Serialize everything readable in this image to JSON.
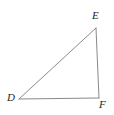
{
  "figure": {
    "name": "triangle-def",
    "background_color": "#ffffff",
    "width": 114,
    "height": 115,
    "stroke_color": "#8a8a8a",
    "stroke_width": 1,
    "label_color": "#231f20",
    "vertices": [
      {
        "id": "D",
        "label": "D",
        "x": 19,
        "y": 99,
        "label_x": 7,
        "label_y": 92
      },
      {
        "id": "E",
        "label": "E",
        "x": 96,
        "y": 28,
        "label_x": 92,
        "label_y": 10
      },
      {
        "id": "F",
        "label": "F",
        "x": 99,
        "y": 98,
        "label_x": 99,
        "label_y": 99
      }
    ],
    "edges": [
      {
        "id": "DE",
        "from": "D",
        "to": "E",
        "x1": 19,
        "y1": 99,
        "x2": 96,
        "y2": 28
      },
      {
        "id": "EF",
        "from": "E",
        "to": "F",
        "x1": 96,
        "y1": 28,
        "x2": 99,
        "y2": 98
      },
      {
        "id": "FD",
        "from": "F",
        "to": "D",
        "x1": 99,
        "y1": 98,
        "x2": 19,
        "y2": 99
      }
    ]
  }
}
